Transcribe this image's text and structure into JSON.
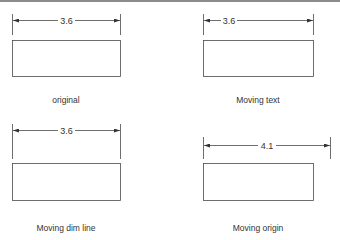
{
  "colors": {
    "line": "#4a4a4a",
    "text": "#333333",
    "border": "#8c8c8c"
  },
  "panels": [
    {
      "id": "original",
      "caption": "original",
      "dimension": "3.6"
    },
    {
      "id": "moving-text",
      "caption": "Moving text",
      "dimension": "3.6"
    },
    {
      "id": "moving-dim-line",
      "caption": "Moving dim line",
      "dimension": "3.6"
    },
    {
      "id": "moving-origin",
      "caption": "Moving origin",
      "dimension": "4.1"
    }
  ]
}
